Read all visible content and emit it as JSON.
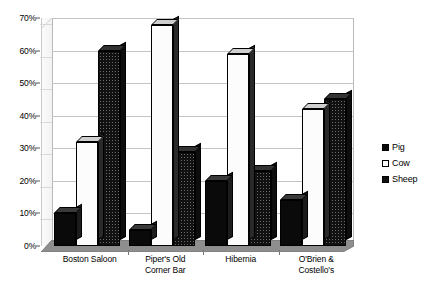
{
  "chart_data": {
    "type": "bar",
    "title": "",
    "subtitle": "",
    "xlabel": "",
    "ylabel": "",
    "ylim": [
      0,
      70
    ],
    "ytick_labels": [
      "0%",
      "10%",
      "20%",
      "30%",
      "40%",
      "50%",
      "60%",
      "70%"
    ],
    "ytick_values": [
      0,
      10,
      20,
      30,
      40,
      50,
      60,
      70
    ],
    "grid": true,
    "legend_position": "right",
    "style": "3d-clustered-column",
    "categories": [
      "Boston Saloon",
      "Piper's Old\nCorner Bar",
      "Hibernia",
      "O'Brien &\nCostello's"
    ],
    "series": [
      {
        "name": "Pig",
        "fill": "solid-black",
        "color": "#0a0a0a",
        "values": [
          10,
          5,
          20,
          14
        ]
      },
      {
        "name": "Cow",
        "fill": "white-dotted",
        "color": "#fcfcfc",
        "values": [
          32,
          68,
          59,
          42
        ]
      },
      {
        "name": "Sheep",
        "fill": "black-checked",
        "color": "#111111",
        "values": [
          60,
          29,
          23,
          45
        ]
      }
    ]
  },
  "legend": {
    "entries": [
      {
        "label": "Pig",
        "swatch": "pig-swatch-icon"
      },
      {
        "label": "Cow",
        "swatch": "cow-swatch-icon"
      },
      {
        "label": "Sheep",
        "swatch": "sheep-swatch-icon"
      }
    ]
  },
  "colors": {
    "plot_background": "#ffffff",
    "gridline": "#c4c4c4",
    "plot_border": "#b9b9b9",
    "floor": "#8e8e8e",
    "wall": "#f5f5f5",
    "text": "#000000"
  }
}
